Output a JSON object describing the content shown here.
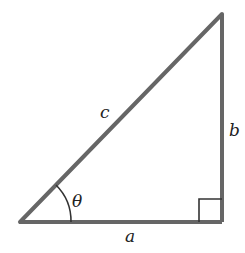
{
  "diagram": {
    "colors": {
      "stroke": "#666666",
      "thin_stroke": "#333333",
      "label": "#222222",
      "background": "#ffffff"
    },
    "vertices": {
      "left": [
        20,
        222
      ],
      "right": [
        222,
        222
      ],
      "top": [
        222,
        14
      ]
    },
    "labels": {
      "hypotenuse": "c",
      "vertical_side": "b",
      "base": "a",
      "angle": "θ"
    },
    "right_angle_marker": true
  }
}
